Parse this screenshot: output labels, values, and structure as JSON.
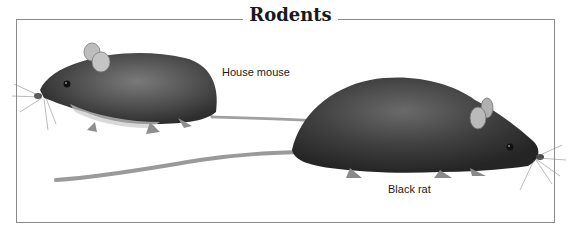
{
  "figure": {
    "title": "Rodents",
    "animals": [
      {
        "name": "House mouse",
        "label": "House mouse"
      },
      {
        "name": "Black rat",
        "label": "Black rat"
      }
    ],
    "colors": {
      "frame": "#8a8a8a",
      "fur_dark": "#3a3a3a",
      "fur_mid": "#6b6b6b",
      "tail": "#9a9a9a",
      "ear": "#b8b8b8"
    }
  }
}
